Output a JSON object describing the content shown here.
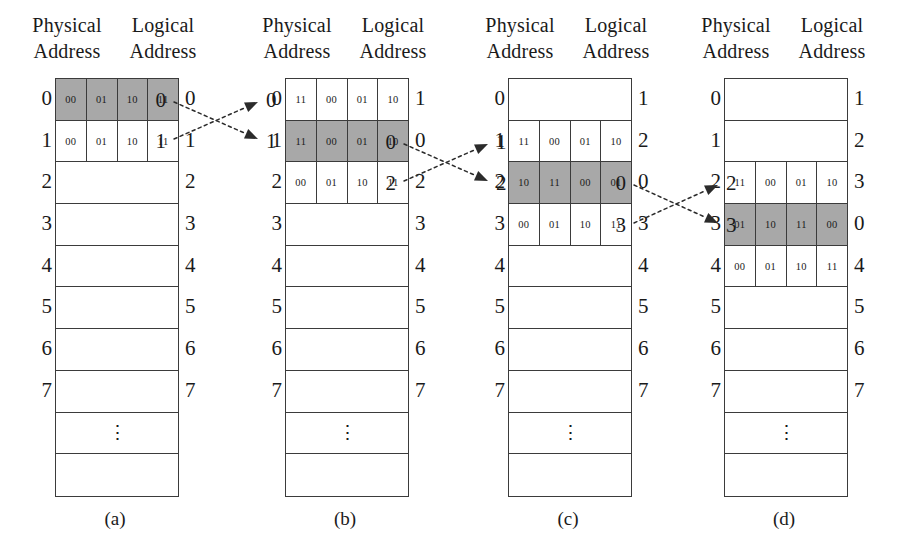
{
  "figure": {
    "caption_labels": [
      "(a)",
      "(b)",
      "(c)",
      "(d)"
    ],
    "header_physical": "Physical",
    "header_logical": "Logical",
    "header_address": "Address",
    "shade_color": "#a8a8a8",
    "line_color": "#3b3b3b",
    "ellipsis_glyph": "⋮"
  },
  "panels": [
    {
      "id": "a",
      "caption": "(a)",
      "header": {
        "line1_left": "Physical",
        "line1_right": "Logical",
        "line2_left": "Address",
        "line2_right": "Address"
      },
      "physical_addresses": [
        "0",
        "1",
        "2",
        "3",
        "4",
        "5",
        "6",
        "7",
        "",
        ""
      ],
      "logical_addresses": [
        "0",
        "1",
        "2",
        "3",
        "4",
        "5",
        "6",
        "7",
        "",
        ""
      ],
      "rows": [
        {
          "cells": [
            "00",
            "01",
            "10",
            "11"
          ],
          "shaded": true,
          "kind": "data"
        },
        {
          "cells": [
            "00",
            "01",
            "10",
            "11"
          ],
          "shaded": false,
          "kind": "data"
        },
        {
          "cells": [],
          "shaded": false,
          "kind": "empty"
        },
        {
          "cells": [],
          "shaded": false,
          "kind": "empty"
        },
        {
          "cells": [],
          "shaded": false,
          "kind": "empty"
        },
        {
          "cells": [],
          "shaded": false,
          "kind": "empty"
        },
        {
          "cells": [],
          "shaded": false,
          "kind": "empty"
        },
        {
          "cells": [],
          "shaded": false,
          "kind": "empty"
        },
        {
          "cells": [],
          "shaded": false,
          "kind": "ellipsis"
        },
        {
          "cells": [],
          "shaded": false,
          "kind": "empty"
        }
      ]
    },
    {
      "id": "b",
      "caption": "(b)",
      "header": {
        "line1_left": "Physical",
        "line1_right": "Logical",
        "line2_left": "Address",
        "line2_right": "Address"
      },
      "physical_addresses": [
        "0",
        "1",
        "2",
        "3",
        "4",
        "5",
        "6",
        "7",
        "",
        ""
      ],
      "logical_addresses": [
        "1",
        "0",
        "2",
        "3",
        "4",
        "5",
        "6",
        "7",
        "",
        ""
      ],
      "rows": [
        {
          "cells": [
            "11",
            "00",
            "01",
            "10"
          ],
          "shaded": false,
          "kind": "data"
        },
        {
          "cells": [
            "11",
            "00",
            "01",
            "10"
          ],
          "shaded": true,
          "kind": "data"
        },
        {
          "cells": [
            "00",
            "01",
            "10",
            "11"
          ],
          "shaded": false,
          "kind": "data"
        },
        {
          "cells": [],
          "shaded": false,
          "kind": "empty"
        },
        {
          "cells": [],
          "shaded": false,
          "kind": "empty"
        },
        {
          "cells": [],
          "shaded": false,
          "kind": "empty"
        },
        {
          "cells": [],
          "shaded": false,
          "kind": "empty"
        },
        {
          "cells": [],
          "shaded": false,
          "kind": "empty"
        },
        {
          "cells": [],
          "shaded": false,
          "kind": "ellipsis"
        },
        {
          "cells": [],
          "shaded": false,
          "kind": "empty"
        }
      ]
    },
    {
      "id": "c",
      "caption": "(c)",
      "header": {
        "line1_left": "Physical",
        "line1_right": "Logical",
        "line2_left": "Address",
        "line2_right": "Address"
      },
      "physical_addresses": [
        "0",
        "1",
        "2",
        "3",
        "4",
        "5",
        "6",
        "7",
        "",
        ""
      ],
      "logical_addresses": [
        "1",
        "2",
        "0",
        "3",
        "4",
        "5",
        "6",
        "7",
        "",
        ""
      ],
      "rows": [
        {
          "cells": [],
          "shaded": false,
          "kind": "empty"
        },
        {
          "cells": [
            "11",
            "00",
            "01",
            "10"
          ],
          "shaded": false,
          "kind": "data"
        },
        {
          "cells": [
            "10",
            "11",
            "00",
            "01"
          ],
          "shaded": true,
          "kind": "data"
        },
        {
          "cells": [
            "00",
            "01",
            "10",
            "11"
          ],
          "shaded": false,
          "kind": "data"
        },
        {
          "cells": [],
          "shaded": false,
          "kind": "empty"
        },
        {
          "cells": [],
          "shaded": false,
          "kind": "empty"
        },
        {
          "cells": [],
          "shaded": false,
          "kind": "empty"
        },
        {
          "cells": [],
          "shaded": false,
          "kind": "empty"
        },
        {
          "cells": [],
          "shaded": false,
          "kind": "ellipsis"
        },
        {
          "cells": [],
          "shaded": false,
          "kind": "empty"
        }
      ]
    },
    {
      "id": "d",
      "caption": "(d)",
      "header": {
        "line1_left": "Physical",
        "line1_right": "Logical",
        "line2_left": "Address",
        "line2_right": "Address"
      },
      "physical_addresses": [
        "0",
        "1",
        "2",
        "3",
        "4",
        "5",
        "6",
        "7",
        "",
        ""
      ],
      "logical_addresses": [
        "1",
        "2",
        "3",
        "0",
        "4",
        "5",
        "6",
        "7",
        "",
        ""
      ],
      "rows": [
        {
          "cells": [],
          "shaded": false,
          "kind": "empty"
        },
        {
          "cells": [],
          "shaded": false,
          "kind": "empty"
        },
        {
          "cells": [
            "11",
            "00",
            "01",
            "10"
          ],
          "shaded": false,
          "kind": "data"
        },
        {
          "cells": [
            "01",
            "10",
            "11",
            "00"
          ],
          "shaded": true,
          "kind": "data"
        },
        {
          "cells": [
            "00",
            "01",
            "10",
            "11"
          ],
          "shaded": false,
          "kind": "data"
        },
        {
          "cells": [],
          "shaded": false,
          "kind": "empty"
        },
        {
          "cells": [],
          "shaded": false,
          "kind": "empty"
        },
        {
          "cells": [],
          "shaded": false,
          "kind": "empty"
        },
        {
          "cells": [],
          "shaded": false,
          "kind": "ellipsis"
        },
        {
          "cells": [],
          "shaded": false,
          "kind": "empty"
        }
      ]
    }
  ],
  "swaps": [
    {
      "id": "a-to-b",
      "from_labels": [
        "0",
        "1"
      ],
      "to_labels": [
        "0",
        "1"
      ],
      "x_from": 168,
      "x_to": 262,
      "y_top": 100,
      "y_bot": 141
    },
    {
      "id": "b-to-c",
      "x_from": 398,
      "x_to": 492,
      "from_labels": [
        "0",
        "2"
      ],
      "to_labels": [
        "1",
        "2"
      ],
      "y_top": 142,
      "y_bot": 183
    },
    {
      "id": "c-to-d",
      "x_from": 628,
      "x_to": 722,
      "from_labels": [
        "0",
        "3"
      ],
      "to_labels": [
        "2",
        "3"
      ],
      "y_top": 183,
      "y_bot": 225
    }
  ]
}
